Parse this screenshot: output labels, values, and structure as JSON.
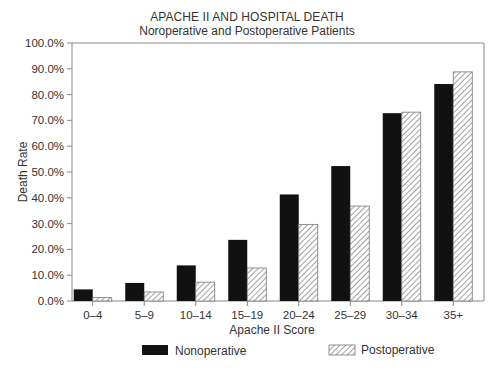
{
  "chart_data": {
    "type": "bar",
    "title": "APACHE II AND HOSPITAL DEATH",
    "subtitle": "Noroperative and Postoperative Patients",
    "xlabel": "Apache II Score",
    "ylabel": "Death Rate",
    "ylim": [
      0,
      100
    ],
    "yticks": [
      "0.0%",
      "10.0%",
      "20.0%",
      "30.0%",
      "40.0%",
      "50.0%",
      "60.0%",
      "70.0%",
      "80.0%",
      "90.0%",
      "100.0%"
    ],
    "categories": [
      "0–4",
      "5–9",
      "10–14",
      "15–19",
      "20–24",
      "25–29",
      "30–34",
      "35+"
    ],
    "series": [
      {
        "name": "Nonoperative",
        "style": "solid-black",
        "color": "#111111",
        "values": [
          4.5,
          7.0,
          13.8,
          23.7,
          41.3,
          52.3,
          72.8,
          84.1
        ]
      },
      {
        "name": "Postoperative",
        "style": "diagonal-hatch",
        "color": "#888888",
        "values": [
          1.3,
          3.5,
          7.3,
          12.8,
          29.7,
          36.8,
          73.2,
          88.8
        ]
      }
    ],
    "grid": false,
    "legend_position": "bottom"
  },
  "legend": {
    "items": [
      {
        "label": "Nonoperative"
      },
      {
        "label": "Postoperative"
      }
    ]
  }
}
